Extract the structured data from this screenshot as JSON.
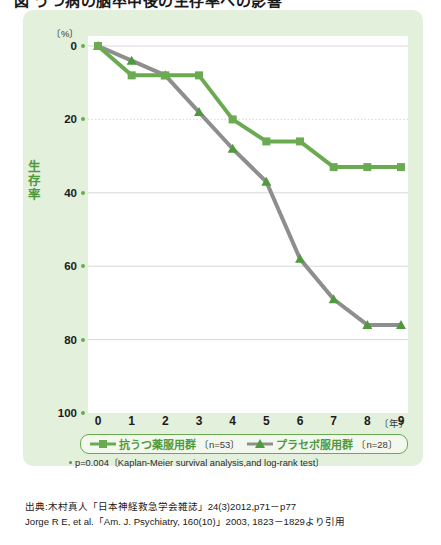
{
  "title": "図 うつ病の脳卒中後の生存率への影響",
  "axes": {
    "y_unit": "〔%〕",
    "y_title": "生存率",
    "y_ticks": [
      "100",
      "80",
      "60",
      "40",
      "20",
      "0"
    ],
    "x_unit": "〔年〕",
    "x_ticks": [
      "0",
      "1",
      "2",
      "3",
      "4",
      "5",
      "6",
      "7",
      "8",
      "9"
    ]
  },
  "legend": {
    "items": [
      {
        "name": "抗うつ薬服用群",
        "n": "〔n=53〕",
        "marker": "square-marker",
        "color": "#6aab52"
      },
      {
        "name": "プラセボ服用群",
        "n": "〔n=28〕",
        "marker": "triangle-marker",
        "color": "#8e8e8e"
      }
    ]
  },
  "footnote": "p=0.004〔Kaplan-Meier survival analysis,and log-rank test〕",
  "source": {
    "line1": "出典:木村真人「日本神経救急学会雑誌」24(3)2012,p71－p77",
    "line2": "Jorge R E, et al.「Am. J. Psychiatry, 160(10)」2003, 1823－1829より引用"
  },
  "colors": {
    "panel_bg": "#e3f0dc",
    "plot_bg": "#ffffff",
    "antidepressant": "#6aab52",
    "placebo": "#8e8e8e",
    "grid": "#d8d8d8",
    "accent_text": "#4f9a3c"
  },
  "chart_data": {
    "type": "line",
    "title": "うつ病の脳卒中後の生存率への影響",
    "xlabel": "〔年〕",
    "ylabel": "生存率",
    "x": [
      0,
      1,
      2,
      3,
      4,
      5,
      6,
      7,
      8,
      9
    ],
    "xlim": [
      0,
      9
    ],
    "ylim": [
      0,
      100
    ],
    "yticks": [
      0,
      20,
      40,
      60,
      80,
      100
    ],
    "grid": "horizontal-dotted",
    "legend_position": "below-axis",
    "series": [
      {
        "name": "抗うつ薬服用群〔n=53〕",
        "short_name": "抗うつ薬服用群",
        "n": 53,
        "color": "#6aab52",
        "marker": "square",
        "values": [
          100,
          92,
          92,
          92,
          80,
          74,
          74,
          67,
          67,
          67
        ]
      },
      {
        "name": "プラセボ服用群〔n=28〕",
        "short_name": "プラセボ服用群",
        "n": 28,
        "color": "#8e8e8e",
        "marker": "triangle",
        "values": [
          100,
          96,
          92,
          82,
          72,
          63,
          42,
          31,
          24,
          24
        ]
      }
    ],
    "annotations": [
      "p=0.004〔Kaplan-Meier survival analysis,and log-rank test〕"
    ]
  }
}
